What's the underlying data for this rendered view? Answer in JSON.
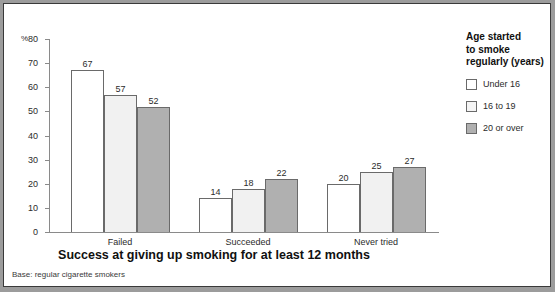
{
  "chart_data": {
    "type": "bar",
    "title": "Success at giving up smoking for at least 12 months",
    "xlabel": "",
    "ylabel": "%",
    "ylim": [
      0,
      80
    ],
    "yticks": [
      0,
      10,
      20,
      30,
      40,
      50,
      60,
      70,
      80
    ],
    "grid": false,
    "legend_position": "right",
    "legend_title": "Age started to smoke regularly (years)",
    "categories": [
      "Failed",
      "Succeeded",
      "Never tried"
    ],
    "series": [
      {
        "name": "Under 16",
        "values": [
          67,
          14,
          20
        ],
        "color": "#ffffff"
      },
      {
        "name": "16 to 19",
        "values": [
          57,
          18,
          25
        ],
        "color": "#f1f1f1"
      },
      {
        "name": "20 or over",
        "values": [
          52,
          22,
          27
        ],
        "color": "#b0b0b0"
      }
    ],
    "annotations": [
      "Base: regular cigarette smokers"
    ]
  },
  "axis": {
    "percent_symbol": "%",
    "tick_labels": [
      "80",
      "70",
      "60",
      "50",
      "40",
      "30",
      "20",
      "10",
      "0"
    ]
  },
  "legend": {
    "title_line1": "Age started",
    "title_line2": "to smoke",
    "title_line3": "regularly (years)",
    "items": [
      {
        "label": "Under 16"
      },
      {
        "label": "16 to 19"
      },
      {
        "label": "20 or over"
      }
    ]
  },
  "title": "Success at giving up smoking for at least 12 months",
  "base_note": "Base: regular cigarette smokers"
}
